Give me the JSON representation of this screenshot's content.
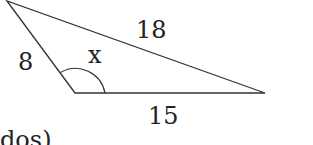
{
  "diagram": {
    "type": "triangle",
    "side_labels": {
      "left": "8",
      "hypotenuse": "18",
      "base": "15"
    },
    "angle_label": "x",
    "stroke_color": "#333333",
    "text_color": "#222222",
    "partial_text": "dos)"
  }
}
